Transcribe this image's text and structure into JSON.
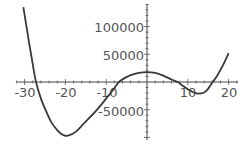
{
  "chart_data": {
    "type": "line",
    "title": "",
    "xlabel": "",
    "ylabel": "",
    "xlim": [
      -30.6,
      22
    ],
    "ylim": [
      -110000,
      145000
    ],
    "grid": false,
    "legend": null,
    "x_ticks": [
      -30,
      -20,
      -10,
      10,
      20
    ],
    "x_tick_labels": [
      "-30",
      "-20",
      "-10",
      "10",
      "20"
    ],
    "y_ticks": [
      100000,
      50000,
      -50000
    ],
    "y_tick_labels": [
      "100000",
      "50000",
      "-50000"
    ],
    "series": [
      {
        "name": "f(x)",
        "color": "#3a3a3a",
        "x": [
          -30.3,
          -29,
          -28,
          -27.2,
          -26,
          -25,
          -23.5,
          -22,
          -21,
          -20,
          -19,
          -17.5,
          -16,
          -14,
          -12.5,
          -11,
          -9.5,
          -8,
          -6.9,
          -5.5,
          -4,
          -2,
          0,
          2,
          4,
          6,
          7.5,
          9,
          10,
          11.5,
          12.5,
          14,
          15,
          16.1,
          17,
          18,
          19,
          20
        ],
        "values": [
          135000,
          75000,
          32000,
          0,
          -30000,
          -48000,
          -72000,
          -87000,
          -94000,
          -97000,
          -96000,
          -90000,
          -79000,
          -64000,
          -52000,
          -39000,
          -25000,
          -11000,
          0,
          7000,
          12500,
          16500,
          18000,
          16500,
          11500,
          4500,
          0,
          -8000,
          -13000,
          -19000,
          -21000,
          -19000,
          -12000,
          0,
          9000,
          22000,
          36000,
          52000
        ]
      }
    ]
  },
  "axes": {
    "origin_px": {
      "x": 147,
      "y": 82
    },
    "x_scale_px_per_unit": 4.08,
    "y_scale_px_per_unit": 0.000554
  }
}
